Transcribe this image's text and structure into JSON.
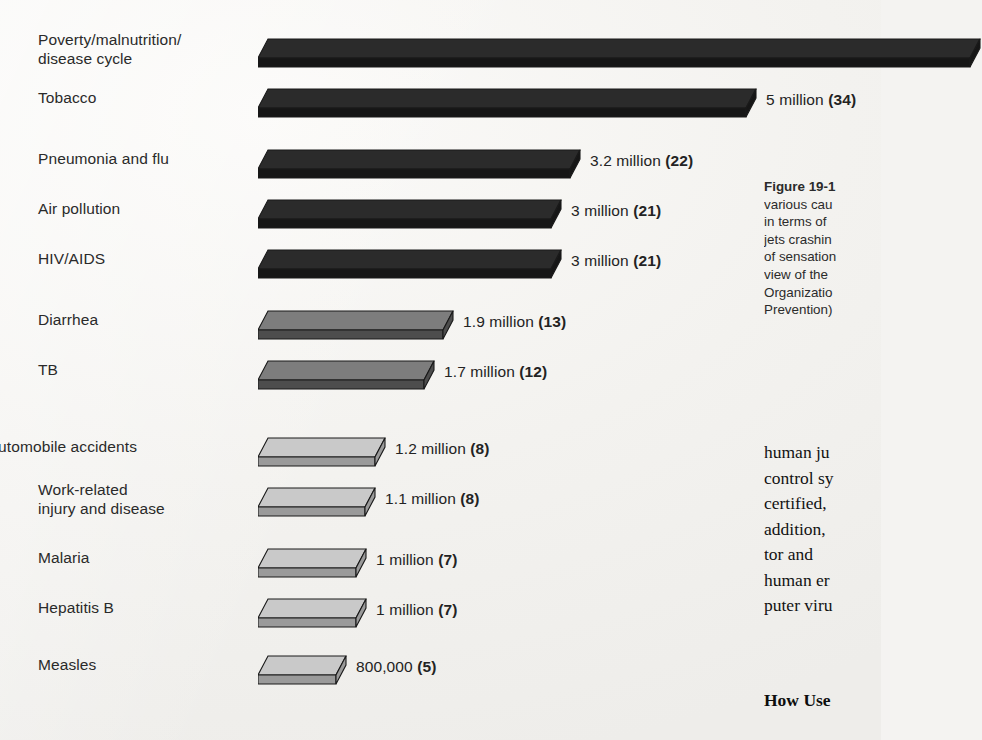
{
  "chart_data": {
    "type": "bar",
    "orientation": "horizontal",
    "title": "",
    "xlabel": "",
    "ylabel": "",
    "grid": false,
    "legend": null,
    "value_unit": "deaths per year",
    "percent_note": "number in parentheses is percent of total deaths",
    "xlim": [
      0,
      7.3
    ],
    "categories": [
      "Poverty/malnutrition/\ndisease cycle",
      "Tobacco",
      "Pneumonia and flu",
      "Air pollution",
      "HIV/AIDS",
      "Diarrhea",
      "TB",
      "Automobile accidents",
      "Work-related\ninjury and disease",
      "Malaria",
      "Hepatitis B",
      "Measles"
    ],
    "values": [
      7.3,
      5,
      3.2,
      3,
      3,
      1.9,
      1.7,
      1.2,
      1.1,
      1,
      1,
      0.8
    ],
    "percents": [
      null,
      34,
      22,
      21,
      21,
      13,
      12,
      8,
      8,
      7,
      7,
      5
    ],
    "value_labels": [
      "",
      "5  million",
      "3.2 million",
      "3 million",
      "3 million",
      "1.9 million",
      "1.7 million",
      "1.2 million",
      "1.1 million",
      "1 million",
      "1 million",
      "800,000"
    ],
    "percent_labels": [
      "",
      "(34)",
      "(22)",
      "(21)",
      "(21)",
      "(13)",
      "(12)",
      "(8)",
      "(8)",
      "(7)",
      "(7)",
      "(5)"
    ],
    "bar_shades": [
      "dark",
      "dark",
      "dark",
      "dark",
      "dark",
      "medium",
      "medium",
      "light",
      "light",
      "light",
      "light",
      "light"
    ],
    "colors": {
      "dark_top": "#2b2b2b",
      "dark_bottom": "#161616",
      "medium_top": "#7d7d7d",
      "medium_bottom": "#4d4d4d",
      "light_top": "#c9c9c9",
      "light_bottom": "#9a9a9a",
      "outline": "#1a1a1a",
      "page_background": "#f4f3f1",
      "text": "#232323"
    }
  },
  "rows": [
    {
      "label": "Poverty/malnutrition/\ndisease cycle",
      "value_label": "",
      "percent_label": "",
      "label_align": "left"
    },
    {
      "label": "Tobacco",
      "value_label": "5  million",
      "percent_label": "(34)",
      "label_align": "left"
    },
    {
      "label": "Pneumonia and flu",
      "value_label": "3.2 million",
      "percent_label": "(22)",
      "label_align": "left"
    },
    {
      "label": "Air pollution",
      "value_label": "3 million",
      "percent_label": "(21)",
      "label_align": "left"
    },
    {
      "label": "HIV/AIDS",
      "value_label": "3 million",
      "percent_label": "(21)",
      "label_align": "left"
    },
    {
      "label": "Diarrhea",
      "value_label": "1.9 million",
      "percent_label": "(13)",
      "label_align": "left"
    },
    {
      "label": "TB",
      "value_label": "1.7 million",
      "percent_label": "(12)",
      "label_align": "left"
    },
    {
      "label": "Automobile accidents",
      "value_label": "1.2 million",
      "percent_label": "(8)",
      "label_align": "right"
    },
    {
      "label": "Work-related\ninjury and disease",
      "value_label": "1.1 million",
      "percent_label": "(8)",
      "label_align": "left"
    },
    {
      "label": "Malaria",
      "value_label": "1 million",
      "percent_label": "(7)",
      "label_align": "left"
    },
    {
      "label": "Hepatitis B",
      "value_label": "1 million",
      "percent_label": "(7)",
      "label_align": "left"
    },
    {
      "label": "Measles",
      "value_label": "800,000",
      "percent_label": "(5)",
      "label_align": "left"
    }
  ],
  "caption": {
    "title": "Figure 19-1",
    "lines": [
      "various cau",
      "in terms of ",
      "jets crashin",
      "of sensation",
      "view of the ",
      "Organizatio",
      "Prevention)"
    ]
  },
  "body_text": {
    "lines": [
      "human ju",
      "control sy",
      "certified, ",
      "addition, ",
      "tor and  ",
      "human er",
      "puter viru"
    ]
  },
  "sub_heading": "How Use"
}
